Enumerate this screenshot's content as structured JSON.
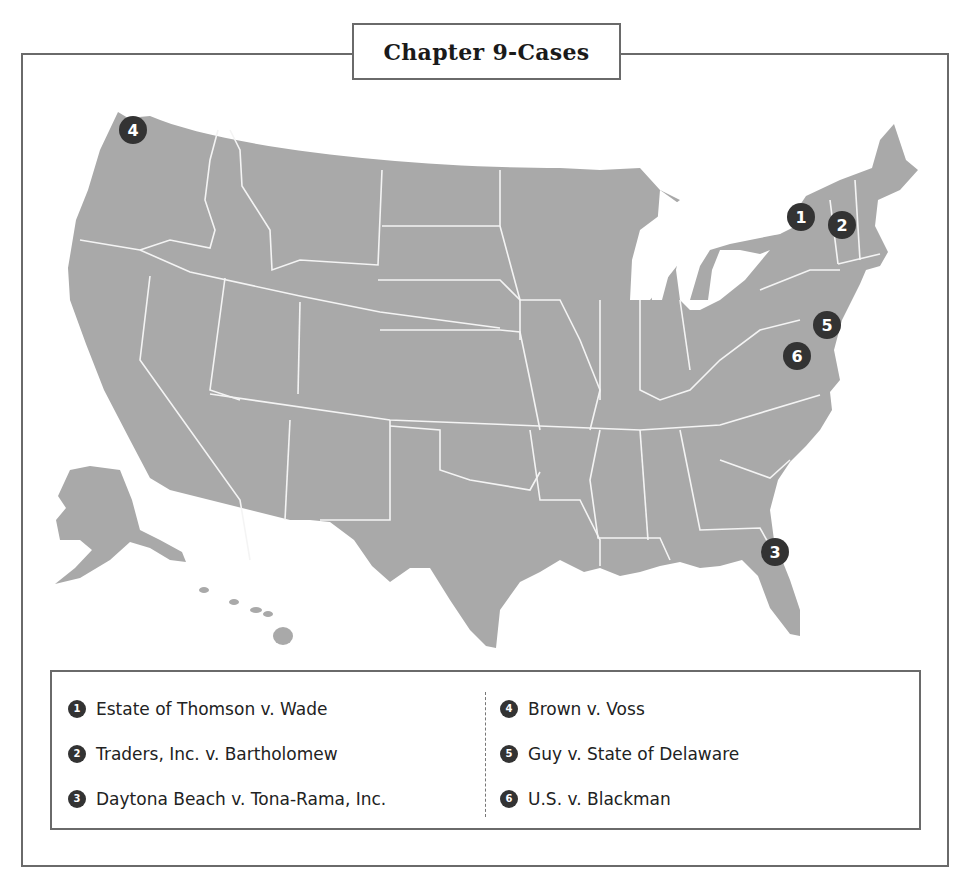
{
  "title": "Chapter 9-Cases",
  "colors": {
    "map_fill": "#a9a9a9",
    "state_border": "#f4f4f4",
    "marker": "#333333",
    "frame": "#6a6a6a"
  },
  "markers": [
    {
      "num": "1",
      "region": "New York",
      "x": 801,
      "y": 217
    },
    {
      "num": "2",
      "region": "Vermont/New Hampshire",
      "x": 842,
      "y": 225
    },
    {
      "num": "3",
      "region": "Florida (Daytona Beach)",
      "x": 775,
      "y": 552
    },
    {
      "num": "4",
      "region": "Washington",
      "x": 133,
      "y": 130
    },
    {
      "num": "5",
      "region": "Delaware",
      "x": 827,
      "y": 325
    },
    {
      "num": "6",
      "region": "Virginia",
      "x": 797,
      "y": 356
    }
  ],
  "legend": {
    "left": [
      {
        "num": "1",
        "label": "Estate of Thomson v. Wade"
      },
      {
        "num": "2",
        "label": "Traders, Inc. v. Bartholomew"
      },
      {
        "num": "3",
        "label": "Daytona Beach v. Tona-Rama, Inc."
      }
    ],
    "right": [
      {
        "num": "4",
        "label": "Brown v. Voss"
      },
      {
        "num": "5",
        "label": "Guy v. State of Delaware"
      },
      {
        "num": "6",
        "label": "U.S. v. Blackman"
      }
    ]
  }
}
